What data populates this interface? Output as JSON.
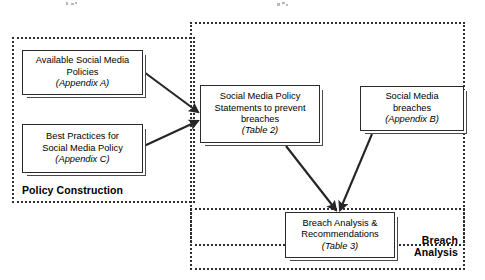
{
  "diagram": {
    "type": "flowchart",
    "regions": [
      {
        "id": "policy-construction",
        "label": "Policy Construction",
        "x": 12,
        "y": 37,
        "width": 183,
        "height": 166,
        "label_x": 22,
        "label_y": 184,
        "label_width": 150,
        "label_align": "left"
      },
      {
        "id": "middle-region",
        "label": "",
        "x": 190,
        "y": 22,
        "width": 275,
        "height": 224,
        "label_x": 0,
        "label_y": 0,
        "label_width": 0,
        "label_align": "left"
      },
      {
        "id": "breach-analysis",
        "label": "Breach\nAnalysis",
        "x": 190,
        "y": 208,
        "width": 275,
        "height": 62,
        "label_x": 398,
        "label_y": 234,
        "label_width": 60,
        "label_align": "right"
      }
    ],
    "nodes": [
      {
        "id": "available-social-media-policies",
        "lines": [
          "Available Social Media",
          "Policies"
        ],
        "ref": "(Appendix A)",
        "x": 22,
        "y": 50,
        "width": 121,
        "height": 45
      },
      {
        "id": "best-practices-for-social-media-policy",
        "lines": [
          "Best Practices for",
          "Social Media Policy"
        ],
        "ref": "(Appendix C)",
        "x": 22,
        "y": 124,
        "width": 121,
        "height": 49
      },
      {
        "id": "social-media-policy-statements",
        "lines": [
          "Social Media Policy",
          "Statements to prevent",
          "breaches"
        ],
        "ref": "(Table 2)",
        "x": 200,
        "y": 85,
        "width": 120,
        "height": 58
      },
      {
        "id": "social-media-breaches",
        "lines": [
          "Social Media",
          "breaches"
        ],
        "ref": "(Appendix B)",
        "x": 360,
        "y": 86,
        "width": 104,
        "height": 45
      },
      {
        "id": "breach-analysis-recommendations",
        "lines": [
          "Breach Analysis &",
          "Recommendations"
        ],
        "ref": "(Table 3)",
        "x": 285,
        "y": 212,
        "width": 110,
        "height": 46
      }
    ],
    "arrows": [
      {
        "id": "policies-to-statements",
        "from": "available-social-media-policies",
        "to": "social-media-policy-statements",
        "x1": 144,
        "y1": 72,
        "x2": 198,
        "y2": 112
      },
      {
        "id": "best-practices-to-statements",
        "from": "best-practices-for-social-media-policy",
        "to": "social-media-policy-statements",
        "x1": 144,
        "y1": 146,
        "x2": 198,
        "y2": 121
      },
      {
        "id": "statements-to-breach-analysis",
        "from": "social-media-policy-statements",
        "to": "breach-analysis-recommendations",
        "x1": 286,
        "y1": 146,
        "x2": 336,
        "y2": 210
      },
      {
        "id": "breaches-to-breach-analysis",
        "from": "social-media-breaches",
        "to": "breach-analysis-recommendations",
        "x1": 372,
        "y1": 134,
        "x2": 340,
        "y2": 210
      }
    ],
    "noise_specks": [
      {
        "x": 66,
        "y": 2,
        "w": 2,
        "h": 3
      },
      {
        "x": 71,
        "y": 3,
        "w": 3,
        "h": 2
      },
      {
        "x": 75,
        "y": 2,
        "w": 2,
        "h": 2
      },
      {
        "x": 277,
        "y": 3,
        "w": 3,
        "h": 3
      },
      {
        "x": 282,
        "y": 2,
        "w": 3,
        "h": 2
      },
      {
        "x": 286,
        "y": 4,
        "w": 2,
        "h": 2
      }
    ]
  }
}
